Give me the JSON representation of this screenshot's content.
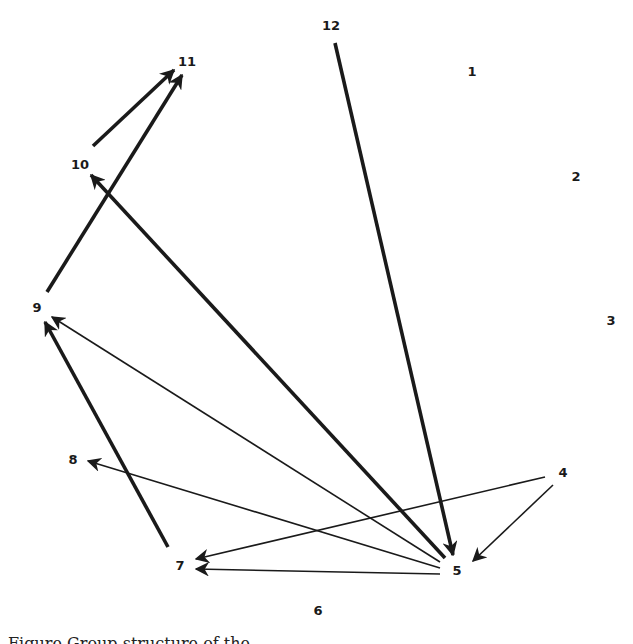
{
  "diagram": {
    "type": "directed-graph",
    "caption": "Figure  Group structure of the ...",
    "nodes": [
      {
        "id": "1",
        "label": "1",
        "x": 472,
        "y": 72
      },
      {
        "id": "2",
        "label": "2",
        "x": 576,
        "y": 177
      },
      {
        "id": "3",
        "label": "3",
        "x": 611,
        "y": 321
      },
      {
        "id": "4",
        "label": "4",
        "x": 563,
        "y": 473
      },
      {
        "id": "5",
        "label": "5",
        "x": 457,
        "y": 571
      },
      {
        "id": "6",
        "label": "6",
        "x": 318,
        "y": 611
      },
      {
        "id": "7",
        "label": "7",
        "x": 180,
        "y": 566
      },
      {
        "id": "8",
        "label": "8",
        "x": 73,
        "y": 460
      },
      {
        "id": "9",
        "label": "9",
        "x": 37,
        "y": 308
      },
      {
        "id": "10",
        "label": "10",
        "x": 80,
        "y": 165
      },
      {
        "id": "11",
        "label": "11",
        "x": 187,
        "y": 62
      },
      {
        "id": "12",
        "label": "12",
        "x": 331,
        "y": 26
      }
    ],
    "edges": [
      {
        "from": "10",
        "to": "11",
        "weight": "thick",
        "x1": 93,
        "y1": 146,
        "x2": 174,
        "y2": 70
      },
      {
        "from": "9",
        "to": "11",
        "weight": "thick",
        "x1": 47,
        "y1": 292,
        "x2": 182,
        "y2": 75
      },
      {
        "from": "12",
        "to": "5",
        "weight": "thick",
        "x1": 335,
        "y1": 43,
        "x2": 453,
        "y2": 555
      },
      {
        "from": "5",
        "to": "10",
        "weight": "thick",
        "x1": 445,
        "y1": 558,
        "x2": 91,
        "y2": 175
      },
      {
        "from": "5",
        "to": "9",
        "weight": "thin",
        "x1": 440,
        "y1": 562,
        "x2": 52,
        "y2": 317
      },
      {
        "from": "7",
        "to": "9",
        "weight": "thick",
        "x1": 168,
        "y1": 547,
        "x2": 45,
        "y2": 322
      },
      {
        "from": "5",
        "to": "8",
        "weight": "thin",
        "x1": 440,
        "y1": 568,
        "x2": 88,
        "y2": 461
      },
      {
        "from": "4",
        "to": "7",
        "weight": "thin",
        "x1": 545,
        "y1": 477,
        "x2": 196,
        "y2": 559
      },
      {
        "from": "5",
        "to": "7",
        "weight": "thin",
        "x1": 440,
        "y1": 574,
        "x2": 196,
        "y2": 569
      },
      {
        "from": "4",
        "to": "5",
        "weight": "thin",
        "x1": 553,
        "y1": 485,
        "x2": 473,
        "y2": 561
      }
    ]
  },
  "colors": {
    "ink": "#1a1a1a",
    "background": "#ffffff"
  }
}
